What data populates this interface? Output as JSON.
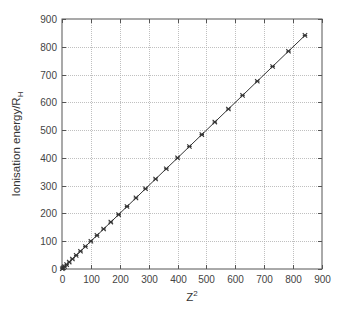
{
  "chart_data": {
    "type": "line",
    "title": "",
    "xlabel": "Z",
    "xlabel_superscript": "2",
    "ylabel": "Ionisation energy/R",
    "ylabel_subscript": "H",
    "xlim": [
      0,
      900
    ],
    "ylim": [
      0,
      900
    ],
    "xticks": [
      0,
      100,
      200,
      300,
      400,
      500,
      600,
      700,
      800,
      900
    ],
    "yticks": [
      0,
      100,
      200,
      300,
      400,
      500,
      600,
      700,
      800,
      900
    ],
    "grid": true,
    "legend": null,
    "series": [
      {
        "name": "Ionisation energy",
        "marker": "x-star",
        "line": "solid",
        "x": [
          1,
          4,
          9,
          16,
          25,
          36,
          49,
          64,
          81,
          100,
          121,
          144,
          169,
          196,
          225,
          256,
          289,
          324,
          361,
          400,
          441,
          484,
          529,
          576,
          625,
          676,
          729,
          784,
          841
        ],
        "y": [
          1,
          4,
          9,
          16,
          25,
          36,
          49,
          64,
          81,
          100,
          121,
          144,
          169,
          196,
          225,
          256,
          289,
          324,
          361,
          400,
          441,
          484,
          529,
          576,
          625,
          676,
          729,
          784,
          841
        ]
      }
    ]
  },
  "colors": {
    "axis": "#555555",
    "grid": "#b0b0b0",
    "series": "#333333"
  }
}
